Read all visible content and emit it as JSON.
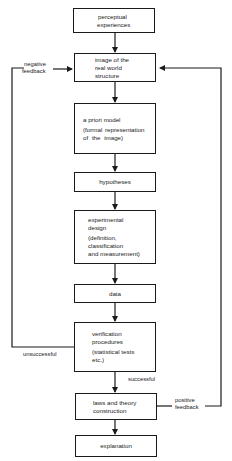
{
  "diagram": {
    "nodes": [
      {
        "id": "perceptual",
        "lines": [
          "perceptual",
          "experiences"
        ]
      },
      {
        "id": "image",
        "lines": [
          "image of the",
          "real world",
          "structure"
        ]
      },
      {
        "id": "apriori",
        "lines": [
          "a priori model",
          "(formal representation",
          "of the image)"
        ]
      },
      {
        "id": "hypotheses",
        "lines": [
          "hypotheses"
        ]
      },
      {
        "id": "experimental",
        "lines": [
          "experimental",
          "design",
          "(definition,",
          "classification",
          "and measurement)"
        ]
      },
      {
        "id": "data",
        "lines": [
          "data"
        ]
      },
      {
        "id": "verification",
        "lines": [
          "verification",
          "procedures",
          "(statistical tests",
          "etc.)"
        ]
      },
      {
        "id": "laws",
        "lines": [
          "laws and theory",
          "construction"
        ]
      },
      {
        "id": "explanation",
        "lines": [
          "explanation"
        ]
      }
    ],
    "labels": {
      "negative_feedback": [
        "negative",
        "feedback"
      ],
      "positive_feedback": [
        "positive",
        "feedback"
      ],
      "unsuccessful": "unsuccessful",
      "successful": "successful"
    },
    "colors": {
      "stroke": "#1a1a1a",
      "background": "#ffffff"
    }
  }
}
